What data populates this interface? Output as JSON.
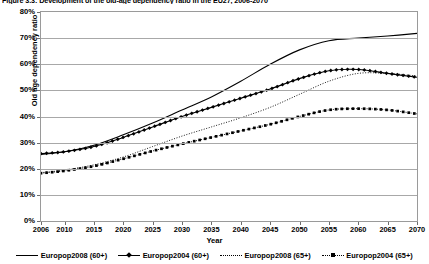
{
  "figure": {
    "caption": "Figure 3.3: Development of the old-age dependency ratio in the EU27, 2006-2070"
  },
  "chart_data": {
    "type": "line",
    "title": "",
    "xlabel": "Year",
    "ylabel": "Old age dependency ratio",
    "xlim": [
      2006,
      2070
    ],
    "ylim": [
      0,
      80
    ],
    "grid": true,
    "legend_position": "bottom",
    "y_ticks": [
      "0%",
      "10%",
      "20%",
      "30%",
      "40%",
      "50%",
      "60%",
      "70%",
      "80%"
    ],
    "y_tick_values": [
      0,
      10,
      20,
      30,
      40,
      50,
      60,
      70,
      80
    ],
    "x_ticks": [
      "2006",
      "2010",
      "2015",
      "2020",
      "2025",
      "2030",
      "2035",
      "2040",
      "2045",
      "2050",
      "2055",
      "2060",
      "2065",
      "2070"
    ],
    "x_tick_values": [
      2006,
      2010,
      2015,
      2020,
      2025,
      2030,
      2035,
      2040,
      2045,
      2050,
      2055,
      2060,
      2065,
      2070
    ],
    "x": [
      2006,
      2010,
      2015,
      2020,
      2025,
      2030,
      2035,
      2040,
      2045,
      2050,
      2055,
      2060,
      2065,
      2070
    ],
    "series": [
      {
        "name": "Europop2008 (60+)",
        "style": "solid",
        "marker": "none",
        "color": "#000000",
        "values": [
          25.5,
          26.5,
          29.0,
          33.0,
          37.5,
          42.5,
          47.5,
          53.5,
          60.0,
          65.5,
          69.0,
          70.0,
          70.8,
          71.8
        ]
      },
      {
        "name": "Europop2004 (60+)",
        "style": "solid",
        "marker": "diamond",
        "color": "#000000",
        "values": [
          25.8,
          26.5,
          28.5,
          32.0,
          36.0,
          40.0,
          43.5,
          47.0,
          50.5,
          54.5,
          57.5,
          58.0,
          56.5,
          55.0
        ]
      },
      {
        "name": "Europop2008 (65+)",
        "style": "dotted",
        "marker": "none",
        "color": "#000000",
        "values": [
          18.5,
          19.5,
          21.5,
          24.5,
          28.5,
          32.5,
          36.0,
          39.5,
          43.5,
          48.5,
          53.5,
          56.5,
          56.5,
          55.5
        ]
      },
      {
        "name": "Europop2004 (65+)",
        "style": "dotted",
        "marker": "square",
        "color": "#000000",
        "values": [
          18.3,
          19.2,
          21.0,
          23.8,
          26.8,
          29.5,
          32.0,
          34.5,
          37.0,
          40.0,
          42.5,
          43.0,
          42.5,
          41.0
        ]
      }
    ]
  }
}
